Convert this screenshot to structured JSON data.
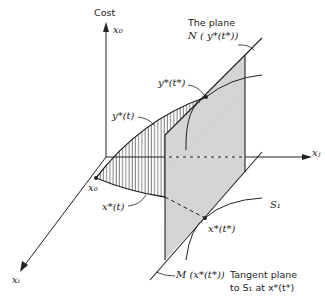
{
  "labels": {
    "cost_axis": "Cost",
    "x0_axis": "x₀",
    "xj_axis": "xⱼ",
    "xi_axis": "xᵢ",
    "x0_point": "x₀",
    "plane_title": "The plane",
    "plane_N": "N ( y*(t*))",
    "y_star_t_star": "y*(t*)",
    "y_star_t": "y*(t)",
    "x_star_t": "x*(t)",
    "x_star_t_star": "x*(t*)",
    "S1": "S₁",
    "M_label": "M (x*(t*))",
    "tangent_line1": "Tangent plane",
    "tangent_line2": "to S₁ at x*(t*)"
  },
  "colors": {
    "line": "#222222",
    "plane_fill": "#d9d9d9",
    "background": "#ffffff"
  }
}
